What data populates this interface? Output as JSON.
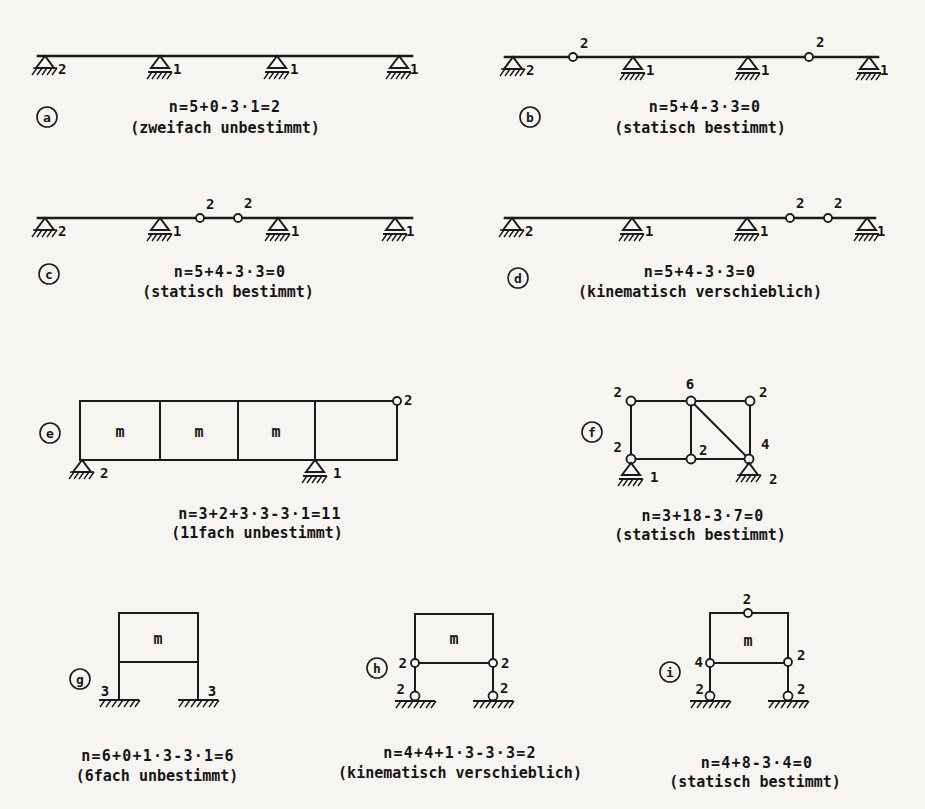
{
  "page": {
    "background": "#f6f5f1",
    "ink": "#1b1b1b"
  },
  "figures": {
    "a": {
      "label": "a",
      "formula": "n=5+0-3·1=2",
      "note": "(zweifach unbestimmt)",
      "supports": [
        "2",
        "1",
        "1",
        "1"
      ]
    },
    "b": {
      "label": "b",
      "formula": "n=5+4-3·3=0",
      "note": "(statisch bestimmt)",
      "supports": [
        "2",
        "1",
        "1",
        "1"
      ],
      "hinges": [
        "2",
        "2"
      ]
    },
    "c": {
      "label": "c",
      "formula": "n=5+4-3·3=0",
      "note": "(statisch bestimmt)",
      "supports": [
        "2",
        "1",
        "1",
        "1"
      ],
      "hinges": [
        "2",
        "2"
      ]
    },
    "d": {
      "label": "d",
      "formula": "n=5+4-3·3=0",
      "note": "(kinematisch verschieblich)",
      "supports": [
        "2",
        "1",
        "1",
        "1"
      ],
      "hinges": [
        "2",
        "2"
      ]
    },
    "e": {
      "label": "e",
      "formula": "n=3+2+3·3-3·1=11",
      "note": "(11fach unbestimmt)",
      "cells": [
        "m",
        "m",
        "m"
      ],
      "hinge": "2",
      "supports": [
        "2",
        "1"
      ]
    },
    "f": {
      "label": "f",
      "formula": "n=3+18-3·7=0",
      "note": "(statisch bestimmt)",
      "nodes": {
        "tl": "2",
        "tm": "6",
        "tr": "2",
        "bl": "2",
        "bm": "2",
        "br": "4"
      },
      "supports": [
        "1",
        "2"
      ]
    },
    "g": {
      "label": "g",
      "formula": "n=6+0+1·3-3·1=6",
      "note": "(6fach unbestimmt)",
      "cell": "m",
      "supports": [
        "3",
        "3"
      ]
    },
    "h": {
      "label": "h",
      "formula": "n=4+4+1·3-3·3=2",
      "note": "(kinematisch verschieblich)",
      "cell": "m",
      "upper_hinges": [
        "2",
        "2"
      ],
      "base_hinges": [
        "2",
        "2"
      ]
    },
    "i": {
      "label": "i",
      "formula": "n=4+8-3·4=0",
      "note": "(statisch bestimmt)",
      "cell": "m",
      "top_hinge": "2",
      "corner_hinges": [
        "4",
        "2"
      ],
      "base_hinges": [
        "2",
        "2"
      ]
    }
  }
}
